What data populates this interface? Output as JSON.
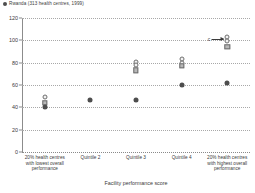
{
  "legend": {
    "marker": "filled-circle",
    "label": "Rwanda (313 health centres, 1999)"
  },
  "annotation": {
    "label": "c"
  },
  "chart_data": {
    "type": "scatter",
    "title": "",
    "subtitle": "",
    "xlabel": "Facility performance score",
    "ylabel": "",
    "ylim": [
      0,
      120
    ],
    "yticks": [
      0,
      20,
      40,
      60,
      80,
      100,
      120
    ],
    "grid": true,
    "legend_position": "top-left",
    "legend_entries": [
      "Rwanda (313 health centres, 1999)"
    ],
    "categories": [
      "20% health centres with lowest overall performance",
      "Quintile 2",
      "Quintile 3",
      "Quintile 4",
      "20% health centres with highest overall performance"
    ],
    "series": [
      {
        "name": "open-circle-upper",
        "marker": "open-circle",
        "values": [
          49,
          null,
          81,
          83,
          103
        ]
      },
      {
        "name": "open-circle-lower",
        "marker": "open-circle",
        "values": [
          null,
          null,
          78,
          80,
          99
        ]
      },
      {
        "name": "open-square",
        "marker": "open-square",
        "values": [
          44,
          null,
          73,
          77,
          94
        ]
      },
      {
        "name": "filled-circle",
        "marker": "filled-circle",
        "values": [
          40,
          47,
          47,
          60,
          62
        ]
      }
    ],
    "annotations": [
      {
        "label": "c",
        "points_to_category": "20% health centres with highest overall performance",
        "points_to_value": 101
      }
    ]
  }
}
